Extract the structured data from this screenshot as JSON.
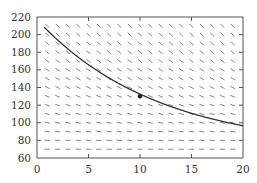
{
  "chart_data": {
    "type": "line",
    "title": "",
    "xlabel": "",
    "ylabel": "",
    "xlim": [
      0,
      20
    ],
    "ylim": [
      60,
      220
    ],
    "x_ticks": [
      0,
      5,
      10,
      15,
      20
    ],
    "y_ticks": [
      60,
      80,
      100,
      120,
      140,
      160,
      180,
      200,
      220
    ],
    "grid": false,
    "legend": null,
    "slope_field": {
      "equation": "dy/dt = -k (y - 70)",
      "t_values": [
        1,
        2,
        3,
        4,
        5,
        6,
        7,
        8,
        9,
        10,
        11,
        12,
        13,
        14,
        15,
        16,
        17,
        18,
        19
      ],
      "y_values": [
        70,
        80,
        90,
        100,
        110,
        120,
        130,
        140,
        150,
        160,
        170,
        180,
        190,
        200,
        210
      ],
      "k": 0.0855,
      "ambient": 70
    },
    "series": [
      {
        "name": "solution curve",
        "model": "y = 70 + 147 e^(-0.0855 t)",
        "x": [
          0.7,
          2,
          4,
          5,
          6,
          8,
          10,
          12,
          14,
          15,
          16,
          18,
          20
        ],
        "values": [
          220,
          196,
          174,
          165,
          157,
          144,
          130,
          123,
          115,
          112,
          108,
          103,
          96
        ]
      }
    ],
    "marked_point": {
      "x": 10,
      "y": 130
    }
  }
}
